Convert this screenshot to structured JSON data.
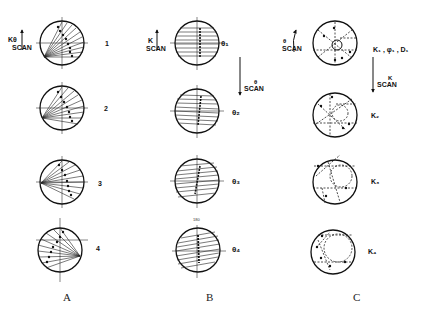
{
  "figure": {
    "columns": [
      {
        "id": "A",
        "label": "A",
        "scan_label_top": "Kθ",
        "scan_label_bottom": "SCAN",
        "rows": [
          {
            "label": "1"
          },
          {
            "label": "2"
          },
          {
            "label": "3"
          },
          {
            "label": "4"
          }
        ]
      },
      {
        "id": "B",
        "label": "B",
        "scan_label_top": "K",
        "scan_label_bottom": "SCAN",
        "vertical_scan_label_top": "θ",
        "vertical_scan_label_bottom": "SCAN",
        "top_tick_label": "180",
        "rows": [
          {
            "label": "θ₁"
          },
          {
            "label": "θ₂"
          },
          {
            "label": "θ₃"
          },
          {
            "label": "θ₄"
          }
        ]
      },
      {
        "id": "C",
        "label": "C",
        "scan_label_top": "θ",
        "scan_label_bottom": "SCAN",
        "vertical_scan_label_top": "K",
        "vertical_scan_label_bottom": "SCAN",
        "rows": [
          {
            "label": "K₁ , φ₁ , D₁"
          },
          {
            "label": "K₂"
          },
          {
            "label": "K₃"
          },
          {
            "label": "K₄"
          }
        ]
      }
    ]
  }
}
